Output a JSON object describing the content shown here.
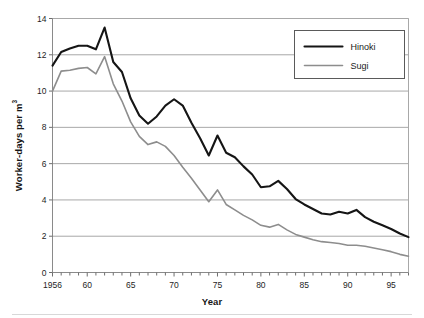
{
  "chart_data": {
    "type": "line",
    "title": "",
    "xlabel": "Year",
    "ylabel": "Worker-days per m³",
    "ylabel_base": "Worker-days per m",
    "ylabel_exponent": "3",
    "xlim": [
      1956,
      1997
    ],
    "ylim": [
      0,
      14
    ],
    "ytick_step": 2,
    "grid": "horizontal",
    "legend_position": "upper right",
    "x": [
      1956,
      1957,
      1958,
      1959,
      1960,
      1961,
      1962,
      1963,
      1964,
      1965,
      1966,
      1967,
      1968,
      1969,
      1970,
      1971,
      1972,
      1973,
      1974,
      1975,
      1976,
      1977,
      1978,
      1979,
      1980,
      1981,
      1982,
      1983,
      1984,
      1985,
      1986,
      1987,
      1988,
      1989,
      1990,
      1991,
      1992,
      1993,
      1994,
      1995,
      1996,
      1997
    ],
    "xticks": [
      1956,
      1960,
      1965,
      1970,
      1975,
      1980,
      1985,
      1990,
      1995
    ],
    "xtick_labels": [
      "1956",
      "60",
      "65",
      "70",
      "75",
      "80",
      "85",
      "90",
      "95"
    ],
    "yticks": [
      0,
      2,
      4,
      6,
      8,
      10,
      12,
      14
    ],
    "ytick_labels": [
      "0",
      "2",
      "4",
      "6",
      "8",
      "10",
      "12",
      "14"
    ],
    "series": [
      {
        "name": "Hinoki",
        "color": "#151515",
        "width": 2.1,
        "values": [
          11.4,
          12.15,
          12.35,
          12.5,
          12.5,
          12.3,
          13.5,
          11.6,
          11.05,
          9.6,
          8.65,
          8.2,
          8.6,
          9.2,
          9.55,
          9.2,
          8.25,
          7.4,
          6.45,
          7.55,
          6.6,
          6.35,
          5.85,
          5.4,
          4.7,
          4.75,
          5.05,
          4.6,
          4.05,
          3.75,
          3.5,
          3.25,
          3.2,
          3.35,
          3.25,
          3.45,
          3.05,
          2.8,
          2.6,
          2.4,
          2.15,
          1.95
        ]
      },
      {
        "name": "Sugi",
        "color": "#8d8d8d",
        "width": 1.6,
        "values": [
          10.0,
          11.1,
          11.15,
          11.25,
          11.3,
          10.95,
          11.9,
          10.4,
          9.45,
          8.3,
          7.5,
          7.05,
          7.2,
          6.95,
          6.45,
          5.8,
          5.2,
          4.55,
          3.9,
          4.55,
          3.75,
          3.45,
          3.15,
          2.9,
          2.6,
          2.5,
          2.65,
          2.35,
          2.1,
          1.95,
          1.8,
          1.7,
          1.65,
          1.6,
          1.5,
          1.5,
          1.45,
          1.35,
          1.25,
          1.15,
          1.0,
          0.9
        ]
      }
    ]
  },
  "legend": {
    "entries": [
      {
        "label": "Hinoki"
      },
      {
        "label": "Sugi"
      }
    ]
  },
  "axes": {
    "x_title": "Year",
    "y_title_base": "Worker-days per m",
    "y_title_exponent": "3"
  }
}
